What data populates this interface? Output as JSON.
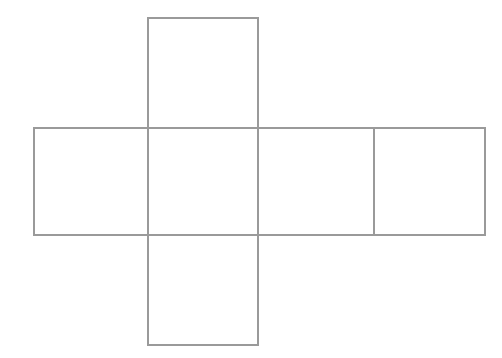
{
  "diagram": {
    "type": "cube-net",
    "stroke_color": "#9a9a9a",
    "background": "#ffffff",
    "faces": [
      {
        "id": "top",
        "x": 147,
        "y": 17,
        "w": 112,
        "h": 112
      },
      {
        "id": "left",
        "x": 33,
        "y": 127,
        "w": 116,
        "h": 109
      },
      {
        "id": "center",
        "x": 147,
        "y": 127,
        "w": 112,
        "h": 109
      },
      {
        "id": "right-1",
        "x": 257,
        "y": 127,
        "w": 118,
        "h": 109
      },
      {
        "id": "right-2",
        "x": 373,
        "y": 127,
        "w": 113,
        "h": 109
      },
      {
        "id": "bottom",
        "x": 147,
        "y": 234,
        "w": 112,
        "h": 112
      }
    ]
  }
}
